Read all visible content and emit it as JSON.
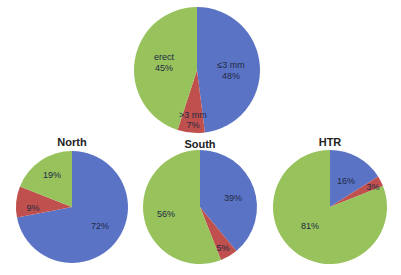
{
  "colors": {
    "small_le3mm": "#5b73c4",
    "large_gt3mm": "#c0504d",
    "erect": "#97c25c"
  },
  "chart_data": [
    {
      "type": "pie",
      "title": "",
      "categories": [
        "≤3 mm",
        ">3 mm",
        "erect"
      ],
      "values": [
        48,
        7,
        45
      ],
      "labels": [
        "≤3 mm\n48%",
        ">3 mm\n7%",
        "erect\n45%"
      ],
      "center": [
        197,
        70
      ],
      "radius": 63
    },
    {
      "type": "pie",
      "title": "North",
      "categories": [
        "≤3 mm",
        ">3 mm",
        "erect"
      ],
      "values": [
        72,
        9,
        19
      ],
      "center": [
        72,
        207
      ],
      "radius": 56
    },
    {
      "type": "pie",
      "title": "South",
      "categories": [
        "≤3 mm",
        ">3 mm",
        "erect"
      ],
      "values": [
        39,
        5,
        56
      ],
      "center": [
        200,
        207
      ],
      "radius": 57
    },
    {
      "type": "pie",
      "title": "HTR",
      "categories": [
        "≤3 mm",
        ">3 mm",
        "erect"
      ],
      "values": [
        16,
        3,
        81
      ],
      "center": [
        330,
        207
      ],
      "radius": 57
    }
  ],
  "titles": {
    "north": "North",
    "south": "South",
    "htr": "HTR"
  },
  "top_labels": {
    "small_name": "≤3 mm",
    "small_pct": "48%",
    "large_name": ">3 mm",
    "large_pct": "7%",
    "erect_name": "erect",
    "erect_pct": "45%"
  },
  "north_labels": {
    "small": "72%",
    "large": "9%",
    "erect": "19%"
  },
  "south_labels": {
    "small": "39%",
    "large": "5%",
    "erect": "56%"
  },
  "htr_labels": {
    "small": "16%",
    "large": "3%",
    "erect": "81%"
  }
}
